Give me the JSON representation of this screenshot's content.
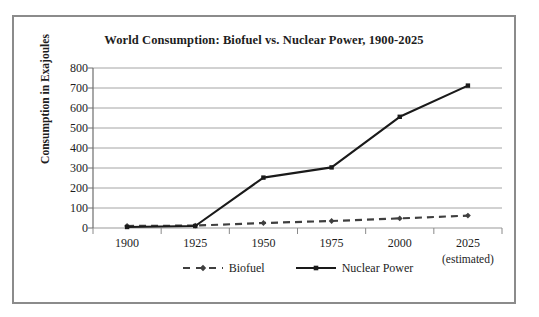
{
  "chart_data": {
    "type": "line",
    "title": "World Consumption: Biofuel vs. Nuclear Power, 1900-2025",
    "xlabel": "",
    "ylabel": "Consumption in Exajoules",
    "categories": [
      "1900",
      "1925",
      "1950",
      "1975",
      "2000",
      "2025"
    ],
    "x_note": "(estimated)",
    "x_note_category": "2025",
    "yticks": [
      0,
      100,
      200,
      300,
      400,
      500,
      600,
      700,
      800
    ],
    "ytick_labels": [
      "0",
      "100",
      "200",
      "300",
      "400",
      "500",
      "600",
      "700",
      "800"
    ],
    "ylim": [
      0,
      800
    ],
    "grid": "horizontal",
    "legend_position": "bottom",
    "series": [
      {
        "name": "Biofuel",
        "values": [
          10,
          12,
          25,
          35,
          48,
          62
        ],
        "color": "#3f3f3f",
        "line_style": "dashed",
        "marker": "diamond"
      },
      {
        "name": "Nuclear Power",
        "values": [
          5,
          10,
          252,
          303,
          556,
          712
        ],
        "color": "#1a1a1a",
        "line_style": "solid",
        "marker": "square"
      }
    ]
  },
  "frame": {
    "border_color": "#8b8b8b",
    "background": "#ffffff"
  }
}
